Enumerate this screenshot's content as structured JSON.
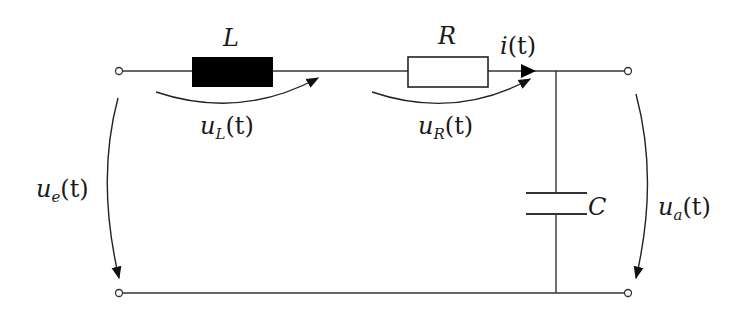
{
  "diagram": {
    "type": "circuit",
    "colors": {
      "wire": "#333333",
      "inductor_fill": "#000000",
      "resistor_fill": "#ffffff",
      "background": "#ffffff"
    },
    "components": {
      "inductor": {
        "symbol": "L"
      },
      "resistor": {
        "symbol": "R"
      },
      "capacitor": {
        "symbol": "C"
      }
    },
    "labels": {
      "current": {
        "base": "i",
        "arg": "(t)"
      },
      "u_L": {
        "base": "u",
        "sub": "L",
        "arg": "(t)"
      },
      "u_R": {
        "base": "u",
        "sub": "R",
        "arg": "(t)"
      },
      "u_e": {
        "base": "u",
        "sub": "e",
        "arg": "(t)"
      },
      "u_a": {
        "base": "u",
        "sub": "a",
        "arg": "(t)"
      }
    }
  }
}
